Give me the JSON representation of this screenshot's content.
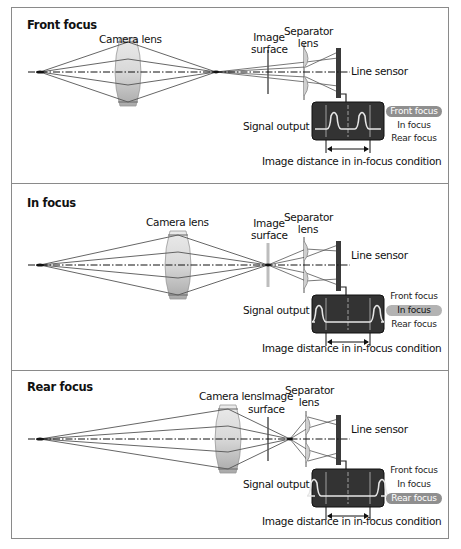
{
  "colors": {
    "panel_border": "#8a8a8a",
    "ray": "#555555",
    "axis": "#111111",
    "lens_fill_top": "#eaeaea",
    "lens_fill_bottom": "#a9a9a9",
    "sensor": "#3a3a3a",
    "scope_bg": "#333333",
    "scope_trace": "#e6e6e6",
    "highlight_dark": "#8f8f8f",
    "highlight_light": "#b3b3b3"
  },
  "labels": {
    "camera_lens": "Camera lens",
    "image_surface_1": "Image",
    "image_surface_2": "surface",
    "separator_lens_1": "Separator",
    "separator_lens_2": "lens",
    "line_sensor": "Line sensor",
    "signal_output": "Signal output",
    "image_distance": "Image distance in in-focus condition",
    "rear_camera_lens_image": "Camera lensImage"
  },
  "focus_states": [
    "Front focus",
    "In focus",
    "Rear focus"
  ],
  "panels": [
    {
      "title": "Front focus",
      "active_state": 0,
      "top": 7,
      "height": 177,
      "object_x": 40,
      "lens_x": 128,
      "focus_x": 216,
      "image_surface_x": 268,
      "separator_x": 306,
      "sensor_x": 338,
      "peak_offsets": [
        -14,
        14
      ]
    },
    {
      "title": "In focus",
      "active_state": 1,
      "top": 183,
      "height": 188,
      "object_x": 40,
      "lens_x": 178,
      "focus_x": 268,
      "image_surface_x": 268,
      "separator_x": 306,
      "sensor_x": 338,
      "peak_offsets": [
        -29,
        29
      ]
    },
    {
      "title": "Rear focus",
      "active_state": 2,
      "top": 370,
      "height": 169,
      "object_x": 40,
      "lens_x": 228,
      "focus_x": 290,
      "image_surface_x": 268,
      "separator_x": 308,
      "sensor_x": 338,
      "peak_offsets": [
        -34,
        34
      ]
    }
  ]
}
